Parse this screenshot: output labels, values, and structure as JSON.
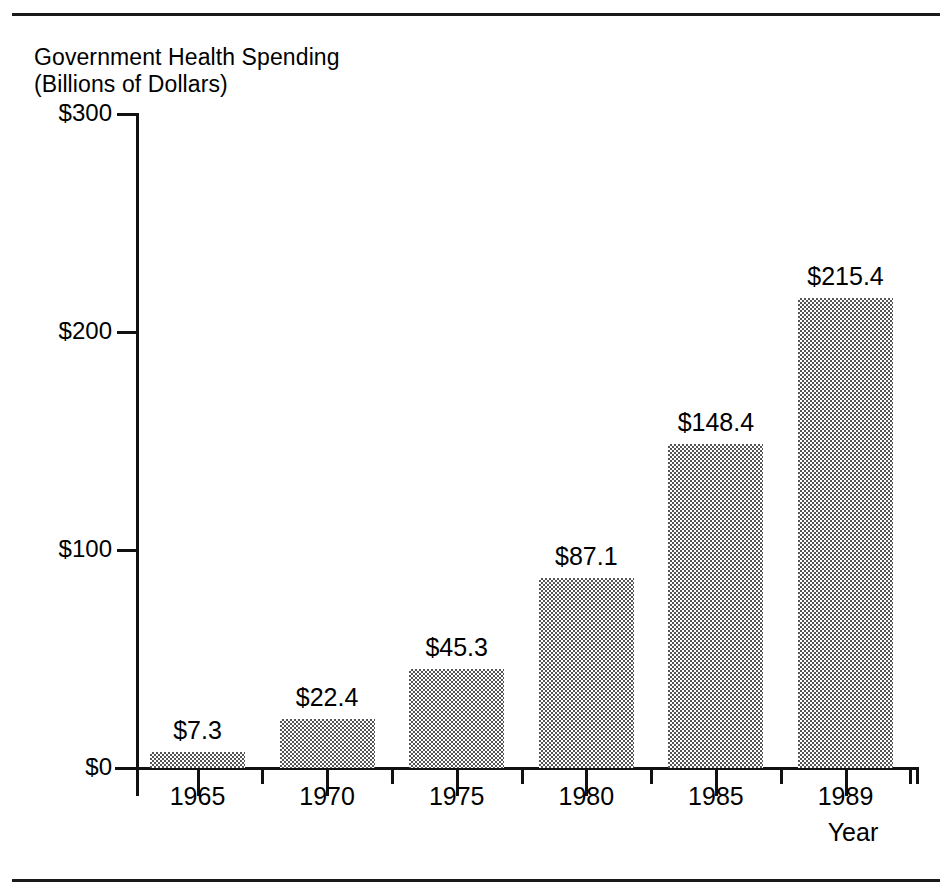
{
  "figure": {
    "caption_line1": "Government Health Spending",
    "caption_line2": "(Billions of Dollars)",
    "x_axis_title": "Year",
    "bar_fill_color": "#a8a8a8",
    "axis_color": "#111111",
    "rule_color": "#1a1a1a"
  },
  "chart_data": {
    "type": "bar",
    "xlabel": "Year",
    "ylabel": "Government Health Spending (Billions of Dollars)",
    "categories": [
      "1965",
      "1970",
      "1975",
      "1980",
      "1985",
      "1989"
    ],
    "values": [
      7.3,
      22.4,
      45.3,
      87.1,
      148.4,
      215.4
    ],
    "data_labels": [
      "$7.3",
      "$22.4",
      "$45.3",
      "$87.1",
      "$148.4",
      "$215.4"
    ],
    "ylim": [
      0,
      300
    ],
    "ytick_values": [
      0,
      100,
      200,
      300
    ],
    "ytick_labels": [
      "$0",
      "$100",
      "$200",
      "$300"
    ],
    "grid": false,
    "legend": false
  }
}
